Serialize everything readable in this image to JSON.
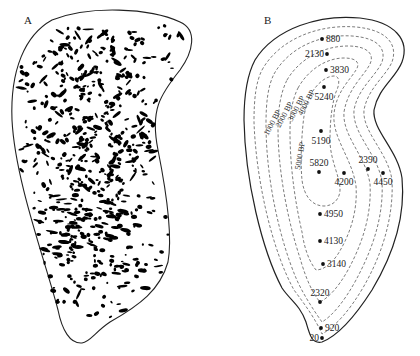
{
  "panels": {
    "a": {
      "label": "A",
      "description": "Artifact distribution (black blobs) within site outline"
    },
    "b": {
      "label": "B",
      "contour_unit": "BP",
      "contours": [
        {
          "label": "1000 BP"
        },
        {
          "label": "2000 BP"
        },
        {
          "label": "3000 BP"
        },
        {
          "label": "4000 BP"
        },
        {
          "label": "5000 BP"
        }
      ],
      "points": [
        {
          "value": "880",
          "x": 322,
          "y": 39
        },
        {
          "value": "2130",
          "x": 327,
          "y": 54
        },
        {
          "value": "3830",
          "x": 326,
          "y": 70
        },
        {
          "value": "5240",
          "x": 324,
          "y": 87
        },
        {
          "value": "5190",
          "x": 321,
          "y": 131
        },
        {
          "value": "5820",
          "x": 319,
          "y": 172
        },
        {
          "value": "4200",
          "x": 344,
          "y": 173
        },
        {
          "value": "2390",
          "x": 368,
          "y": 169
        },
        {
          "value": "4450",
          "x": 383,
          "y": 173
        },
        {
          "value": "4950",
          "x": 320,
          "y": 214
        },
        {
          "value": "4130",
          "x": 320,
          "y": 241
        },
        {
          "value": "3140",
          "x": 323,
          "y": 264
        },
        {
          "value": "2320",
          "x": 320,
          "y": 302
        },
        {
          "value": "920",
          "x": 321,
          "y": 328
        },
        {
          "value": "20",
          "x": 322,
          "y": 338
        }
      ]
    }
  }
}
